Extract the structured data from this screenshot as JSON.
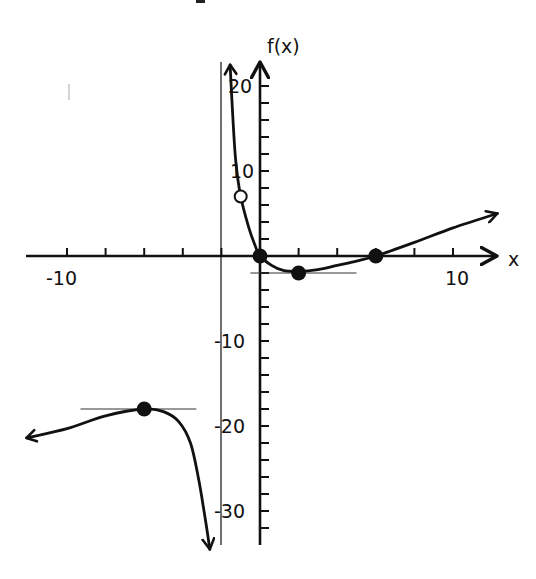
{
  "chart_data": {
    "type": "line",
    "title": "",
    "xlabel": "x",
    "ylabel": "f(x)",
    "xlim": [
      -12,
      12
    ],
    "ylim": [
      -33,
      22
    ],
    "grid": false,
    "legend": null,
    "x_ticks_step": 2,
    "y_ticks_step": 2,
    "x_tick_labels": [
      {
        "value": -10,
        "label": "-10"
      },
      {
        "value": 10,
        "label": "10"
      }
    ],
    "y_tick_labels": [
      {
        "value": 20,
        "label": "20"
      },
      {
        "value": 10,
        "label": "10"
      },
      {
        "value": -10,
        "label": "-10"
      },
      {
        "value": -20,
        "label": "-20"
      },
      {
        "value": -30,
        "label": "-30"
      }
    ],
    "vertical_asymptote": {
      "x": -2
    },
    "series": [
      {
        "name": "right branch (x > -2)",
        "points": [
          [
            -1.55,
            22.5
          ],
          [
            -1.4,
            16
          ],
          [
            -1.25,
            11
          ],
          [
            -1.0,
            7
          ],
          [
            -0.6,
            3.5
          ],
          [
            -0.25,
            1.2
          ],
          [
            0,
            0
          ],
          [
            0.6,
            -1.1
          ],
          [
            1.2,
            -1.7
          ],
          [
            2,
            -1.8
          ],
          [
            3,
            -1.6
          ],
          [
            4,
            -1.1
          ],
          [
            5,
            -0.6
          ],
          [
            6,
            0
          ],
          [
            8,
            1.6
          ],
          [
            10,
            3.3
          ],
          [
            12.3,
            5
          ]
        ],
        "end_arrows": [
          "up",
          "right"
        ]
      },
      {
        "name": "left branch (x < -2)",
        "points": [
          [
            -12.1,
            -21.4
          ],
          [
            -10,
            -20.3
          ],
          [
            -8,
            -18.8
          ],
          [
            -6,
            -18
          ],
          [
            -5,
            -18.3
          ],
          [
            -4.2,
            -19.5
          ],
          [
            -3.6,
            -22
          ],
          [
            -3.2,
            -26
          ],
          [
            -2.9,
            -30
          ],
          [
            -2.6,
            -34.5
          ]
        ],
        "end_arrows": [
          "left",
          "down"
        ]
      }
    ],
    "marked_points": [
      {
        "x": 0,
        "y": 0,
        "style": "closed",
        "note": "x-intercept / y-intercept"
      },
      {
        "x": 2,
        "y": -2,
        "style": "closed",
        "note": "local minimum"
      },
      {
        "x": 6,
        "y": 0,
        "style": "closed",
        "note": "x-intercept"
      },
      {
        "x": -6,
        "y": -18,
        "style": "closed",
        "note": "local maximum"
      },
      {
        "x": -1,
        "y": 7,
        "style": "open",
        "note": "hole"
      }
    ],
    "tangent_lines": [
      {
        "at": [
          2,
          -2
        ],
        "x_range": [
          -0.5,
          5
        ]
      },
      {
        "at": [
          -6,
          -18
        ],
        "x_range": [
          -9.3,
          -3.3
        ]
      }
    ]
  },
  "labels": {
    "x_axis": "x",
    "y_axis": "f(x)",
    "x_neg10": "-10",
    "x_pos10": "10",
    "y_20": "20",
    "y_10": "10",
    "y_neg10": "-10",
    "y_neg20": "-20",
    "y_neg30": "-30"
  }
}
